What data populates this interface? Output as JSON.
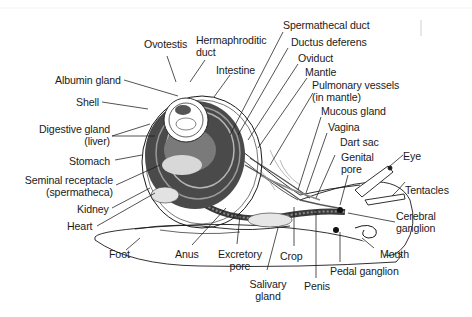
{
  "diagram": {
    "title": "",
    "colors": {
      "background": "#ffffff",
      "ink": "#1a1a1a",
      "shade_dark": "#3a3a3a",
      "shade_mid": "#6e6e6e",
      "shade_light": "#bdbdbd"
    },
    "labels": {
      "ovotestis": "Ovotestis",
      "hermaphroditic_duct_1": "Hermaphroditic",
      "hermaphroditic_duct_2": "duct",
      "intestine": "Intestine",
      "albumin_gland": "Albumin gland",
      "shell": "Shell",
      "digestive_gland_1": "Digestive gland",
      "digestive_gland_2": "(liver)",
      "stomach": "Stomach",
      "seminal_receptacle_1": "Seminal receptacle",
      "seminal_receptacle_2": "(spermatheca)",
      "kidney": "Kidney",
      "heart": "Heart",
      "foot": "Foot",
      "anus": "Anus",
      "excretory_pore_1": "Excretory",
      "excretory_pore_2": "pore",
      "salivary_gland_1": "Salivary",
      "salivary_gland_2": "gland",
      "crop": "Crop",
      "penis": "Penis",
      "pedal_ganglion": "Pedal ganglion",
      "mouth": "Mouth",
      "cerebral_ganglion_1": "Cerebral",
      "cerebral_ganglion_2": "ganglion",
      "tentacles": "Tentacles",
      "eye": "Eye",
      "genital_pore_1": "Genital",
      "genital_pore_2": "pore",
      "dart_sac": "Dart sac",
      "vagina": "Vagina",
      "mucous_gland": "Mucous gland",
      "pulmonary_vessels_1": "Pulmonary vessels",
      "pulmonary_vessels_2": "(in mantle)",
      "mantle": "Mantle",
      "oviduct": "Oviduct",
      "ductus_deferens": "Ductus deferens",
      "spermathecal_duct": "Spermathecal duct"
    }
  }
}
